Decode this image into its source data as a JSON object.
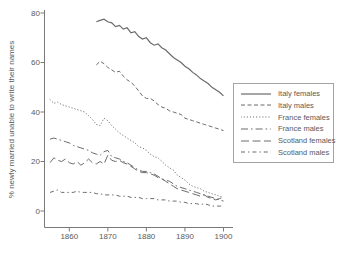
{
  "chart_data": {
    "type": "line",
    "title": "",
    "xlabel": "",
    "ylabel": "% newly married unable to write their names",
    "xlim": [
      1853,
      1902
    ],
    "ylim": [
      0,
      80
    ],
    "xticks": [
      1860,
      1870,
      1880,
      1890,
      1900
    ],
    "yticks": [
      80,
      60,
      40,
      20,
      0
    ],
    "grid": false,
    "legend_position": "right",
    "colors": {
      "line": "#6b6b6b",
      "axis": "#7a7a7a",
      "text": "#5a5a5a",
      "background": "#ffffff",
      "legend_border": "#a3a3a3"
    },
    "x_step": 1,
    "series": [
      {
        "name": "Italy females",
        "line_style": "solid",
        "start_year": 1867,
        "values": [
          76.5,
          77,
          77.5,
          76.5,
          76,
          74.5,
          75,
          73.5,
          74,
          72,
          72.5,
          70.5,
          69.5,
          70,
          68,
          67,
          67.5,
          66,
          65,
          63.5,
          62,
          61,
          60,
          58.5,
          57.5,
          56,
          55,
          53.5,
          52.5,
          51.5,
          50,
          49,
          48,
          46.5
        ]
      },
      {
        "name": "Italy males",
        "line_style": "dash",
        "start_year": 1867,
        "values": [
          59,
          60.5,
          59.5,
          58,
          57,
          56,
          56.5,
          54.5,
          53,
          52,
          50.5,
          48.5,
          46.5,
          45.5,
          45.5,
          44.5,
          43,
          42,
          41.5,
          40.5,
          40,
          39.5,
          39,
          37.5,
          37,
          36.5,
          36,
          35.5,
          35,
          34.5,
          34,
          33.5,
          33,
          32.5
        ]
      },
      {
        "name": "France females",
        "line_style": "dot",
        "start_year": 1855,
        "values": [
          45,
          43.5,
          44,
          43,
          42.5,
          42,
          41.5,
          41,
          40.5,
          40,
          38.5,
          37,
          35,
          34.5,
          37.5,
          36.5,
          34.5,
          33,
          31.5,
          30.5,
          29.5,
          28.5,
          27.5,
          26,
          25.5,
          24.5,
          23,
          22,
          21.5,
          20,
          18.5,
          17.5,
          16.5,
          14.5,
          13.5,
          12.5,
          11,
          10,
          9.5,
          9,
          8,
          7.5,
          7,
          6.5,
          6,
          5.5
        ]
      },
      {
        "name": "France males",
        "line_style": "longdash-dot",
        "start_year": 1855,
        "values": [
          29,
          29.5,
          29,
          28.5,
          28,
          27.5,
          26.5,
          26,
          25.5,
          25,
          24.5,
          23.5,
          23,
          22.5,
          24,
          24.5,
          22,
          21.5,
          21,
          20,
          19.5,
          18.5,
          17.5,
          16.5,
          16,
          16,
          15.5,
          15,
          14,
          13,
          12.5,
          12,
          11,
          10,
          9.5,
          9,
          8.5,
          8,
          7.5,
          7,
          6.5,
          6,
          5.5,
          5,
          4.5,
          4
        ]
      },
      {
        "name": "Scotland females",
        "line_style": "longdash",
        "start_year": 1855,
        "values": [
          19.5,
          21.5,
          20.5,
          20,
          21,
          19.5,
          19,
          20,
          18.5,
          19.5,
          21,
          19.5,
          19,
          20,
          19,
          22.5,
          20.5,
          20,
          20.5,
          19.5,
          19,
          18,
          17,
          16,
          15.5,
          15.5,
          15,
          14.5,
          13.5,
          13,
          12,
          11,
          10,
          9,
          8.5,
          8,
          7.5,
          7,
          6.5,
          6,
          6.5,
          5.5,
          5,
          4.5,
          5,
          5.5
        ]
      },
      {
        "name": "Scotland males",
        "line_style": "dash-dot",
        "start_year": 1855,
        "values": [
          7.5,
          8,
          8.5,
          7.5,
          7.5,
          7.5,
          7.5,
          8,
          7.5,
          7.5,
          7.5,
          7.5,
          7,
          7,
          6.5,
          6.5,
          6.5,
          6.5,
          6,
          6,
          6,
          5.5,
          5.5,
          5.5,
          5,
          5,
          5,
          5,
          4.5,
          4.5,
          4.5,
          4,
          4,
          4,
          3.5,
          3.5,
          3,
          3,
          3,
          2.5,
          3,
          2.5,
          2,
          2,
          2,
          2
        ]
      }
    ]
  }
}
